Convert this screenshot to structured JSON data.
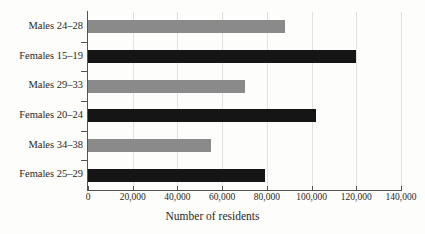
{
  "chart_data": {
    "type": "bar",
    "orientation": "horizontal",
    "title": "",
    "xlabel": "Number of residents",
    "ylabel": "",
    "xlim": [
      0,
      140000
    ],
    "xticks": [
      0,
      20000,
      40000,
      60000,
      80000,
      100000,
      120000,
      140000
    ],
    "xtick_labels": [
      "0",
      "20,000",
      "40,000",
      "60,000",
      "80,000",
      "100,000",
      "120,000",
      "140,000"
    ],
    "grid": true,
    "legend": "none",
    "categories": [
      "Males 24–28",
      "Females 15–19",
      "Males 29–33",
      "Females 20–24",
      "Males 34–38",
      "Females 25–29"
    ],
    "values": [
      88000,
      120000,
      70000,
      102000,
      55000,
      79000
    ],
    "bars": [
      {
        "label": "Males 24–28",
        "value": 88000,
        "group": "males",
        "color": "#8a8a8a"
      },
      {
        "label": "Females 15–19",
        "value": 120000,
        "group": "females",
        "color": "#151515"
      },
      {
        "label": "Males 29–33",
        "value": 70000,
        "group": "males",
        "color": "#8a8a8a"
      },
      {
        "label": "Females 20–24",
        "value": 102000,
        "group": "females",
        "color": "#151515"
      },
      {
        "label": "Males 34–38",
        "value": 55000,
        "group": "males",
        "color": "#8a8a8a"
      },
      {
        "label": "Females 25–29",
        "value": 79000,
        "group": "females",
        "color": "#151515"
      }
    ],
    "colors": {
      "males": "#8a8a8a",
      "females": "#151515",
      "axis": "#56524d",
      "grid": "#e3e1dd",
      "background": "#fdfdfc",
      "text": "#2a2723"
    }
  }
}
